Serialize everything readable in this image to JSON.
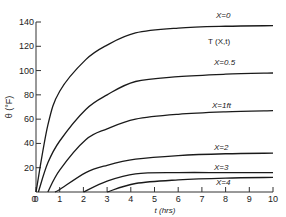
{
  "chart_data": {
    "type": "line",
    "title": "",
    "annotation": "T (X,t)",
    "xlabel": "t (hrs)",
    "ylabel": "θ (°F)",
    "xlim": [
      0,
      10
    ],
    "ylim": [
      0,
      140
    ],
    "xticks": [
      0,
      1,
      2,
      3,
      4,
      5,
      6,
      7,
      8,
      9,
      10
    ],
    "yticks": [
      20,
      40,
      60,
      80,
      100,
      120,
      140
    ],
    "grid": false,
    "legend": "inline labels above curves",
    "series": [
      {
        "name": "X=0",
        "x": [
          0,
          0.5,
          1,
          2.1,
          3,
          4.2,
          6,
          8,
          10
        ],
        "y": [
          0,
          55,
          83,
          109,
          121,
          131,
          135,
          136.5,
          137
        ]
      },
      {
        "name": "X=0.5",
        "x": [
          0.1,
          0.5,
          1,
          2.1,
          3,
          4.2,
          6,
          8,
          10
        ],
        "y": [
          0,
          24,
          42,
          68,
          80,
          91,
          95,
          97,
          98
        ]
      },
      {
        "name": "X=1ft",
        "x": [
          0.5,
          1,
          2.1,
          3,
          4.2,
          6,
          8,
          10
        ],
        "y": [
          0,
          18,
          43,
          52,
          60,
          64,
          66,
          67
        ]
      },
      {
        "name": "X=2",
        "x": [
          0.8,
          1,
          2.1,
          3,
          4.2,
          6,
          8,
          10
        ],
        "y": [
          0,
          2,
          16,
          22,
          27,
          30,
          31.5,
          32
        ]
      },
      {
        "name": "X=3",
        "x": [
          2,
          3,
          4.2,
          6,
          8,
          10
        ],
        "y": [
          0,
          9,
          15,
          16,
          16,
          16
        ]
      },
      {
        "name": "X=4",
        "x": [
          3,
          4.2,
          6,
          8,
          10
        ],
        "y": [
          0,
          7,
          10,
          11.5,
          12
        ]
      }
    ]
  },
  "labels": {
    "x_axis": "t (hrs)",
    "y_axis": "θ (°F)",
    "annotation": "T (X,t)",
    "series_labels": [
      "X=0",
      "X=0.5",
      "X=1ft",
      "X=2",
      "X=3",
      "X=4"
    ]
  }
}
